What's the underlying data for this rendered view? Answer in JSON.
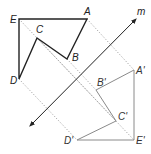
{
  "diagram": {
    "line_m": {
      "label": "m",
      "start": [
        30,
        126
      ],
      "end": [
        136,
        19
      ],
      "label_pos": [
        137,
        15
      ],
      "color": "#222222"
    },
    "original": {
      "stroke": "#222222",
      "vertices": [
        {
          "name": "A",
          "x": 87,
          "y": 19,
          "lx": 84,
          "ly": 15
        },
        {
          "name": "B",
          "x": 67,
          "y": 59,
          "lx": 72,
          "ly": 61
        },
        {
          "name": "C",
          "x": 37,
          "y": 38,
          "lx": 36,
          "ly": 33
        },
        {
          "name": "D",
          "x": 19,
          "y": 79,
          "lx": 10,
          "ly": 84
        },
        {
          "name": "E",
          "x": 19,
          "y": 19,
          "lx": 10,
          "ly": 23
        }
      ]
    },
    "image": {
      "stroke": "#8a8a8a",
      "vertices": [
        {
          "name": "A'",
          "x": 134,
          "y": 70,
          "lx": 136,
          "ly": 74
        },
        {
          "name": "B'",
          "x": 96,
          "y": 90,
          "lx": 97,
          "ly": 86
        },
        {
          "name": "C'",
          "x": 116,
          "y": 121,
          "lx": 118,
          "ly": 120
        },
        {
          "name": "D'",
          "x": 77,
          "y": 140,
          "lx": 64,
          "ly": 144
        },
        {
          "name": "E'",
          "x": 134,
          "y": 140,
          "lx": 136,
          "ly": 144
        }
      ]
    },
    "connector_style": {
      "stroke": "#9a9a9a",
      "dash": "1.2 1.8"
    }
  }
}
